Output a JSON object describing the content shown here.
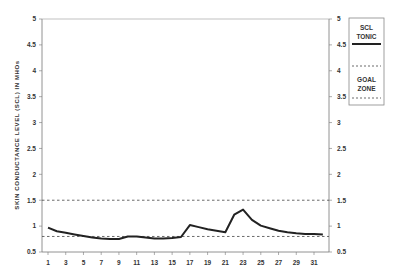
{
  "chart_data": {
    "type": "line",
    "title": "",
    "xlabel": "",
    "ylabel": "SKIN CONDUCTANCE LEVEL (SCL) IN MHOs",
    "ylim": [
      0.5,
      5
    ],
    "yticks": [
      "0.5",
      "1",
      "1.5",
      "2",
      "2.5",
      "3",
      "3.5",
      "4",
      "4.5",
      "5"
    ],
    "xticks": [
      "1",
      "3",
      "5",
      "7",
      "9",
      "11",
      "13",
      "15",
      "17",
      "19",
      "21",
      "23",
      "25",
      "27",
      "29",
      "31"
    ],
    "grid": false,
    "legend_position": "right",
    "x": [
      1,
      2,
      3,
      4,
      5,
      6,
      7,
      8,
      9,
      10,
      11,
      12,
      13,
      14,
      15,
      16,
      17,
      18,
      19,
      20,
      21,
      22,
      23,
      24,
      25,
      26,
      27,
      28,
      29,
      30,
      31,
      32
    ],
    "series": [
      {
        "name": "SCL TONIC",
        "style": "solid",
        "values": [
          0.97,
          0.9,
          0.87,
          0.84,
          0.81,
          0.78,
          0.76,
          0.75,
          0.75,
          0.8,
          0.8,
          0.78,
          0.76,
          0.76,
          0.77,
          0.79,
          1.02,
          0.98,
          0.94,
          0.91,
          0.88,
          1.22,
          1.32,
          1.12,
          1.01,
          0.96,
          0.91,
          0.88,
          0.86,
          0.85,
          0.85,
          0.84
        ]
      },
      {
        "name": "GOAL ZONE upper",
        "style": "dashed",
        "constant": 1.5
      },
      {
        "name": "GOAL ZONE lower",
        "style": "dashed",
        "constant": 0.8
      }
    ],
    "legend": [
      {
        "label_lines": [
          "SCL",
          "TONIC"
        ],
        "style": "solid"
      },
      {
        "label_lines": [
          "GOAL",
          "ZONE"
        ],
        "style": "dashed"
      }
    ]
  },
  "labels": {
    "ylabel": "SKIN CONDUCTANCE LEVEL (SCL) IN MHOs",
    "legend_scl_1": "SCL",
    "legend_scl_2": "TONIC",
    "legend_goal_1": "GOAL",
    "legend_goal_2": "ZONE"
  }
}
